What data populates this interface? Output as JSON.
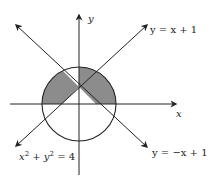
{
  "diagram": {
    "type": "coordinate-graph",
    "axes": {
      "x_label": "x",
      "y_label": "y"
    },
    "curves": [
      {
        "name": "circle",
        "equation": "x² + y² = 4",
        "eq_parts": [
          "x",
          "2",
          " + ",
          "y",
          "2",
          " = 4"
        ]
      },
      {
        "name": "line1",
        "equation": "y = x + 1"
      },
      {
        "name": "line2",
        "equation": "y = −x + 1"
      }
    ],
    "shaded_region": "inside circle, above both lines y = x + 1 and y = −x + 1 complement: region between lines above x-axis",
    "colors": {
      "shade": "#8c8c8c",
      "stroke": "#222222"
    }
  }
}
